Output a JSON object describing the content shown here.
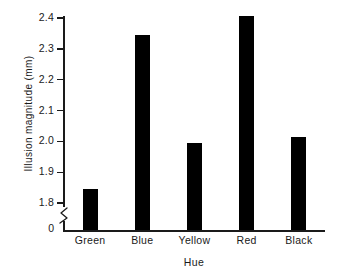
{
  "chart_data": {
    "type": "bar",
    "title": "",
    "subtitle": "",
    "xlabel": "Hue",
    "ylabel": "Illusion magnitude (mm)",
    "categories": [
      "Green",
      "Blue",
      "Yellow",
      "Red",
      "Black"
    ],
    "values": [
      1.845,
      2.345,
      1.995,
      2.405,
      2.015
    ],
    "series": [
      {
        "name": "Illusion magnitude",
        "values": [
          1.845,
          2.345,
          1.995,
          2.405,
          2.015
        ]
      }
    ],
    "ylim": [
      1.75,
      2.44
    ],
    "yticks": [
      1.8,
      1.9,
      2.0,
      2.1,
      2.2,
      2.3,
      2.4
    ],
    "ytick_labels": [
      "1.8",
      "1.9",
      "2.0",
      "2.1",
      "2.2",
      "2.3",
      "2.4"
    ],
    "zero_label": "0",
    "axis_break": true,
    "grid": false,
    "legend": "none",
    "bar_color": "#000000",
    "axis_color": "#1a1a1a",
    "background_color": "#ffffff"
  }
}
